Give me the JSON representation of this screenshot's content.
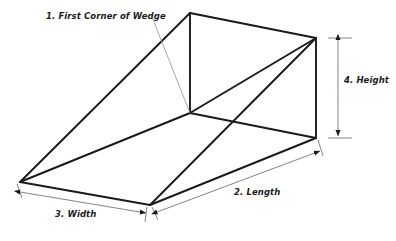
{
  "figure": {
    "shape_name": "wedge",
    "background_color": "#ffffff",
    "line_color": "#1a1a1a",
    "dimension_line_color": "#6e6e6e",
    "leader_line_color": "#9a9a9a",
    "text_color": "#1c1c1c"
  },
  "annotations": {
    "first_corner": {
      "number": "1.",
      "name": "First Corner of Wedge",
      "label": "1. First Corner of Wedge"
    },
    "length": {
      "number": "2.",
      "name": "Length",
      "label": "2. Length"
    },
    "width": {
      "number": "3.",
      "name": "Width",
      "label": "3. Width"
    },
    "height": {
      "number": "4.",
      "name": "Height",
      "label": "4. Height"
    }
  },
  "geometry": {
    "description": "Wireframe wedge (triangular prism) drawn in oblique projection",
    "vertices": {
      "apex_top": [
        190,
        13
      ],
      "first_corner": [
        190,
        113
      ],
      "back_top_right": [
        316,
        38
      ],
      "back_bottom_right": [
        316,
        138
      ],
      "left_corner": [
        20,
        182
      ],
      "front_bottom": [
        150,
        205
      ]
    },
    "edges": [
      [
        "left_corner",
        "apex_top"
      ],
      [
        "apex_top",
        "back_top_right"
      ],
      [
        "apex_top",
        "first_corner"
      ],
      [
        "back_top_right",
        "back_bottom_right"
      ],
      [
        "first_corner",
        "back_bottom_right"
      ],
      [
        "first_corner",
        "back_top_right"
      ],
      [
        "left_corner",
        "first_corner"
      ],
      [
        "left_corner",
        "front_bottom"
      ],
      [
        "front_bottom",
        "back_bottom_right"
      ],
      [
        "front_bottom",
        "back_top_right"
      ]
    ]
  },
  "dimensions": {
    "height": {
      "label": "4. Height",
      "orientation": "vertical",
      "from": [
        338,
        38
      ],
      "to": [
        338,
        138
      ],
      "arrowheads": "both"
    },
    "length": {
      "label": "2. Length",
      "orientation": "diagonal",
      "from": [
        156,
        212
      ],
      "to": [
        320,
        151
      ],
      "arrowheads": "both"
    },
    "width": {
      "label": "3. Width",
      "orientation": "diagonal",
      "from": [
        20,
        192
      ],
      "to": [
        146,
        213
      ],
      "arrowheads": "both"
    }
  },
  "leaders": [
    {
      "name": "first-corner-leader",
      "from": [
        152,
        17
      ],
      "to": [
        190,
        113
      ]
    }
  ]
}
